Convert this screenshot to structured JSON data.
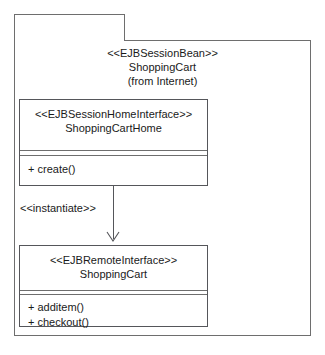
{
  "diagram": {
    "type": "uml-class-diagram",
    "package": {
      "tab_label": "",
      "stereotype": "<<EJBSessionBean>>",
      "name": "ShoppingCart",
      "source": "(from Internet)"
    },
    "classes": [
      {
        "id": "home",
        "stereotype": "<<EJBSessionHomeInterface>>",
        "name": "ShoppingCartHome",
        "operations": [
          "+ create()"
        ]
      },
      {
        "id": "remote",
        "stereotype": "<<EJBRemoteInterface>>",
        "name": "ShoppingCart",
        "operations": [
          "+ additem()",
          "+ checkout()"
        ]
      }
    ],
    "relationship": {
      "label": "<<instantiate>>",
      "kind": "dependency",
      "from": "ShoppingCartHome",
      "to": "ShoppingCart"
    },
    "colors": {
      "background": "#ffffff",
      "stroke": "#55565a",
      "package_stroke": "#6e6e6e",
      "text": "#1a1a1a"
    }
  }
}
